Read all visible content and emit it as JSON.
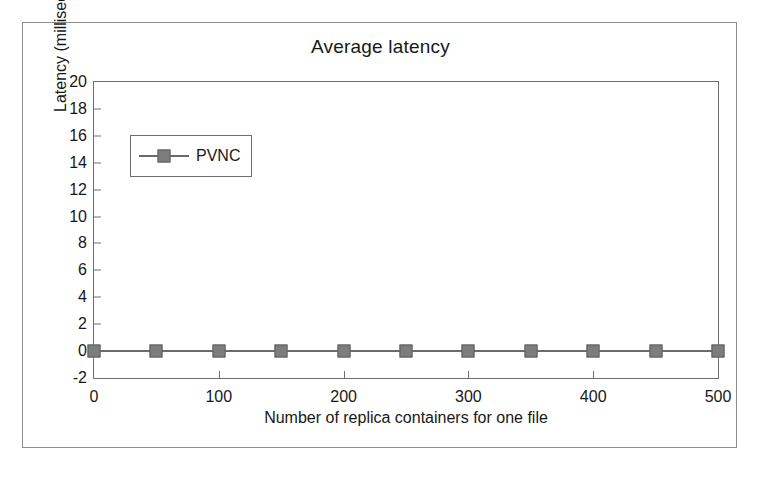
{
  "figure": {
    "title": "Average latency",
    "background_color": "#ffffff",
    "frame_color": "#8d8d8d"
  },
  "chart_data": {
    "type": "line",
    "title": "Average latency",
    "xlabel": "Number of replica containers for one file",
    "ylabel": "Latency (milliseconds)",
    "xlim": [
      0,
      500
    ],
    "ylim": [
      -2,
      20
    ],
    "grid": false,
    "legend_position": "upper-left-inside",
    "x_ticks": [
      0,
      100,
      200,
      300,
      400,
      500
    ],
    "x_tick_labels": [
      "0",
      "100",
      "200",
      "300",
      "400",
      "500"
    ],
    "y_ticks": [
      -2,
      0,
      2,
      4,
      6,
      8,
      10,
      12,
      14,
      16,
      18,
      20
    ],
    "y_tick_labels": [
      "-2",
      "0",
      "2",
      "4",
      "6",
      "8",
      "10",
      "12",
      "14",
      "16",
      "18",
      "20"
    ],
    "x": [
      0,
      50,
      100,
      150,
      200,
      250,
      300,
      350,
      400,
      450,
      500
    ],
    "series": [
      {
        "name": "PVNC",
        "marker": "square",
        "color": "#7d7d7d",
        "line_color": "#6b6b6b",
        "values": [
          0,
          0,
          0,
          0,
          0,
          0,
          0,
          0,
          0,
          0,
          0
        ]
      }
    ]
  },
  "legend": {
    "entries": [
      {
        "label": "PVNC",
        "marker": "square-marker",
        "color": "#7d7d7d"
      }
    ]
  }
}
